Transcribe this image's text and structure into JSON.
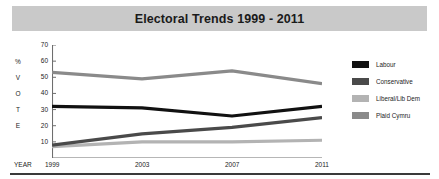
{
  "chart_data": {
    "type": "line",
    "title": "Electoral Trends 1999 - 2011",
    "xlabel": "YEAR",
    "ylabel": "% VOTE",
    "ylabel_chars": [
      "%",
      "V",
      "O",
      "T",
      "E"
    ],
    "categories": [
      "1999",
      "2003",
      "2007",
      "2011"
    ],
    "x": [
      1999,
      2003,
      2007,
      2011
    ],
    "xticks": [
      "1999",
      "2003",
      "2007",
      "2011"
    ],
    "yticks": [
      10,
      20,
      30,
      40,
      50,
      60,
      70
    ],
    "ylim": [
      0,
      70
    ],
    "grid": false,
    "legend_position": "right",
    "series": [
      {
        "name": "Labour",
        "color": "#111111",
        "values": [
          32,
          31,
          26,
          32
        ]
      },
      {
        "name": "Conservative",
        "color": "#4a4a4a",
        "values": [
          8,
          15,
          19,
          25
        ]
      },
      {
        "name": "Liberal/Lib Dem",
        "color": "#b3b3b3",
        "values": [
          7,
          10,
          10,
          11
        ]
      },
      {
        "name": "Plaid Cymru",
        "color": "#8a8a8a",
        "values": [
          53,
          49,
          54,
          46
        ]
      }
    ]
  },
  "legend": {
    "items": [
      {
        "label": "Labour",
        "color": "#111111"
      },
      {
        "label": "Conservative",
        "color": "#4a4a4a"
      },
      {
        "label": "Liberal/Lib Dem",
        "color": "#b3b3b3"
      },
      {
        "label": "Plaid Cymru",
        "color": "#8a8a8a"
      }
    ]
  },
  "colors": {
    "title_banner": "#c9c9c9",
    "axis": "#6e6e6e",
    "text": "#242424",
    "rule": "#3a3a3a"
  }
}
